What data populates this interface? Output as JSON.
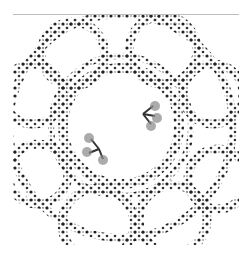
{
  "image": {
    "subject": "fractal-julia-set",
    "description": "Black and gray Julia-set fractal with nested ring-like loops of dendritic filaments on a white background",
    "colors": {
      "background": "#ffffff",
      "ink": "#1a1a1a",
      "mid": "#555555",
      "edge": "#bdbdbd"
    }
  }
}
